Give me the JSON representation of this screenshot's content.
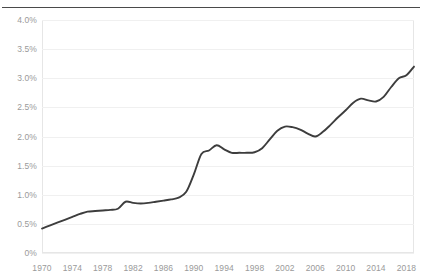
{
  "chart_data": {
    "type": "line",
    "title": "",
    "subtitle": "",
    "xlabel": "",
    "ylabel": "",
    "xlim": [
      1970,
      2019
    ],
    "ylim": [
      0,
      4.0
    ],
    "y_unit": "%",
    "grid": true,
    "legend": "none",
    "y_ticks": [
      0,
      0.5,
      1.0,
      1.5,
      2.0,
      2.5,
      3.0,
      3.5,
      4.0
    ],
    "y_tick_labels": [
      "0%",
      "0.5%",
      "1.0%",
      "1.5%",
      "2.0%",
      "2.5%",
      "3.0%",
      "3.5%",
      "4.0%"
    ],
    "x_ticks": [
      1970,
      1974,
      1978,
      1982,
      1986,
      1990,
      1994,
      1998,
      2002,
      2006,
      2010,
      2014,
      2018
    ],
    "x_tick_labels": [
      "1970",
      "1974",
      "1978",
      "1982",
      "1986",
      "1990",
      "1994",
      "1998",
      "2002",
      "2006",
      "2010",
      "2014",
      "2018"
    ],
    "line_color": "#3d3d3d",
    "series": [
      {
        "name": "series-1",
        "x": [
          1970,
          1971,
          1972,
          1973,
          1974,
          1975,
          1976,
          1977,
          1978,
          1979,
          1980,
          1981,
          1982,
          1983,
          1984,
          1985,
          1986,
          1987,
          1988,
          1989,
          1990,
          1991,
          1992,
          1993,
          1994,
          1995,
          1996,
          1997,
          1998,
          1999,
          2000,
          2001,
          2002,
          2003,
          2004,
          2005,
          2006,
          2007,
          2008,
          2009,
          2010,
          2011,
          2012,
          2013,
          2014,
          2015,
          2016,
          2017,
          2018,
          2019
        ],
        "values": [
          0.42,
          0.47,
          0.52,
          0.57,
          0.62,
          0.67,
          0.71,
          0.72,
          0.73,
          0.74,
          0.76,
          0.88,
          0.86,
          0.85,
          0.86,
          0.88,
          0.9,
          0.92,
          0.95,
          1.05,
          1.35,
          1.7,
          1.76,
          1.85,
          1.78,
          1.72,
          1.72,
          1.72,
          1.73,
          1.8,
          1.95,
          2.1,
          2.17,
          2.16,
          2.12,
          2.05,
          2.0,
          2.08,
          2.2,
          2.33,
          2.45,
          2.58,
          2.65,
          2.62,
          2.6,
          2.68,
          2.85,
          3.0,
          3.05,
          3.2
        ]
      }
    ]
  }
}
